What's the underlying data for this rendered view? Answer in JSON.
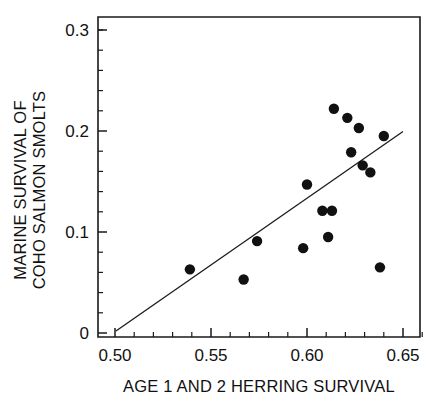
{
  "chart_data": {
    "type": "scatter",
    "title": "",
    "xlabel": "AGE 1 AND 2 HERRING SURVIVAL",
    "ylabel_line1": "MARINE SURVIVAL OF",
    "ylabel_line2": "COHO SALMON SMOLTS",
    "xlim": [
      0.5,
      0.6667
    ],
    "ylim": [
      0.0,
      0.3175
    ],
    "xticks": [
      0.5,
      0.55,
      0.6,
      0.65
    ],
    "xtick_labels": [
      "0.50",
      "0.55",
      "0.60",
      "0.65"
    ],
    "xticks_minor": [
      0.51,
      0.52,
      0.53,
      0.54,
      0.56,
      0.57,
      0.58,
      0.59,
      0.61,
      0.62,
      0.63,
      0.64,
      0.66
    ],
    "yticks": [
      0.0,
      0.1,
      0.2,
      0.3
    ],
    "ytick_labels": [
      "0",
      "0.1",
      "0.2",
      "0.3"
    ],
    "yticks_minor": [
      0.02,
      0.04,
      0.06,
      0.08,
      0.12,
      0.14,
      0.16,
      0.18,
      0.22,
      0.24,
      0.26,
      0.28,
      0.3
    ],
    "grid": false,
    "legend": false,
    "marker_color": "#111111",
    "marker_size": 5.2,
    "points": [
      {
        "x": 0.539,
        "y": 0.063
      },
      {
        "x": 0.567,
        "y": 0.053
      },
      {
        "x": 0.574,
        "y": 0.091
      },
      {
        "x": 0.598,
        "y": 0.084
      },
      {
        "x": 0.6,
        "y": 0.147
      },
      {
        "x": 0.608,
        "y": 0.121
      },
      {
        "x": 0.613,
        "y": 0.121
      },
      {
        "x": 0.611,
        "y": 0.095
      },
      {
        "x": 0.614,
        "y": 0.222
      },
      {
        "x": 0.621,
        "y": 0.213
      },
      {
        "x": 0.623,
        "y": 0.179
      },
      {
        "x": 0.627,
        "y": 0.203
      },
      {
        "x": 0.629,
        "y": 0.166
      },
      {
        "x": 0.633,
        "y": 0.159
      },
      {
        "x": 0.64,
        "y": 0.195
      },
      {
        "x": 0.638,
        "y": 0.065
      }
    ],
    "fit_line": {
      "x0": 0.5005,
      "y0": 0.002,
      "x1": 0.65,
      "y1": 0.1995,
      "color": "#1a1a1a"
    }
  }
}
